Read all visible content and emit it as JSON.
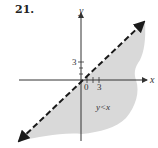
{
  "problem": {
    "number": "21."
  },
  "graph": {
    "axis_labels": {
      "x": "x",
      "y": "y"
    },
    "origin_label": "0",
    "y_tick_label": "3",
    "x_tick_label": "3",
    "region_label": "y<x",
    "boundary": {
      "equation": "y = x",
      "style": "dashed"
    },
    "shading": "below line",
    "colors": {
      "shade": "#d9d9d9",
      "line": "#1a1a1a",
      "axis": "#333333"
    }
  }
}
